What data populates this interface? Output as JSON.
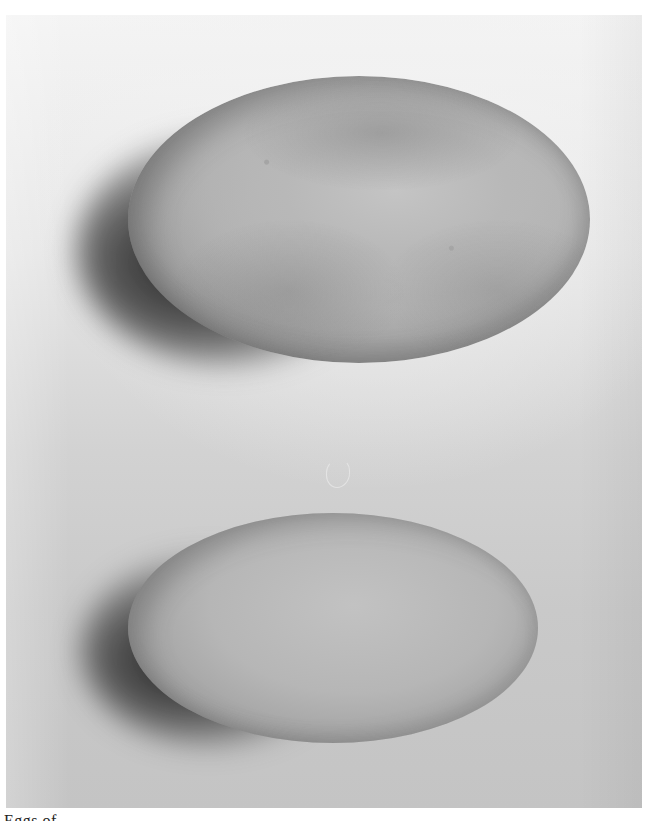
{
  "image": {
    "description": "Black-and-white photograph of two bird eggs on a light background, each casting a dark shadow to the left",
    "subjects": [
      {
        "name": "upper egg",
        "appearance": "large oval egg with mottled, slightly darker speckled shell"
      },
      {
        "name": "lower egg",
        "appearance": "smaller smooth oval egg with even pale shell"
      }
    ],
    "colors": {
      "background_top": "#f4f4f4",
      "background_bottom": "#c4c4c4",
      "egg_top": "#b8b8b8",
      "egg_bottom": "#b6b6b6",
      "shadow": "#1e1e1e"
    }
  },
  "caption": {
    "text": "Eggs of ...",
    "clipped": true
  }
}
